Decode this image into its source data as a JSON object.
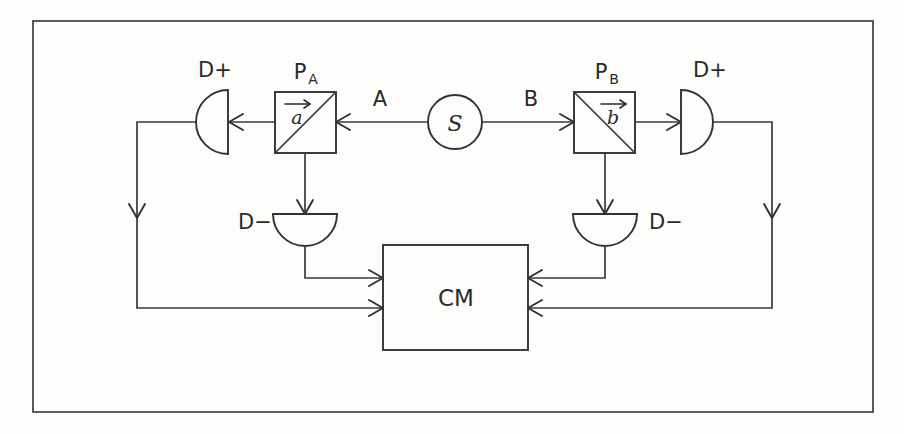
{
  "diagram": {
    "source": {
      "label": "S",
      "name": "source"
    },
    "channels": [
      {
        "label": "A",
        "side": "left"
      },
      {
        "label": "B",
        "side": "right"
      }
    ],
    "polarizers": [
      {
        "label": "P",
        "subscript": "A",
        "vector": "a",
        "side": "left"
      },
      {
        "label": "P",
        "subscript": "B",
        "vector": "b",
        "side": "right"
      }
    ],
    "detectors": [
      {
        "label": "D+",
        "side": "left",
        "position": "upper"
      },
      {
        "label": "D−",
        "side": "left",
        "position": "lower"
      },
      {
        "label": "D+",
        "side": "right",
        "position": "upper"
      },
      {
        "label": "D−",
        "side": "right",
        "position": "lower"
      }
    ],
    "coincidence_monitor": {
      "label": "CM",
      "name": "coincidence-monitor"
    },
    "colors": {
      "ink": "#333333",
      "paper": "#fdfdfc",
      "frame": "#4a4a4a"
    }
  }
}
